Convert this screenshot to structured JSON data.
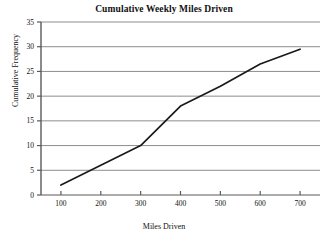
{
  "chart_data": {
    "type": "line",
    "title": "Cumulative Weekly Miles Driven",
    "xlabel": "Miles Driven",
    "ylabel": "Cumulative Frequency",
    "x": [
      100,
      200,
      300,
      400,
      500,
      600,
      700
    ],
    "values": [
      2,
      6,
      10,
      18,
      22,
      26.5,
      29.5
    ],
    "series": [
      {
        "name": "Cumulative Frequency",
        "values": [
          2,
          6,
          10,
          18,
          22,
          26.5,
          29.5
        ]
      }
    ],
    "xlim": [
      50,
      750
    ],
    "ylim": [
      0,
      35
    ],
    "xticks": [
      100,
      200,
      300,
      400,
      500,
      600,
      700
    ],
    "xtick_labels": [
      "100",
      "200",
      "300",
      "400",
      "500",
      "600",
      "700"
    ],
    "yticks": [
      0,
      5,
      10,
      15,
      20,
      25,
      30,
      35
    ],
    "ytick_labels": [
      "0",
      "5",
      "10",
      "15",
      "20",
      "25",
      "30",
      "35"
    ],
    "grid": "horizontal",
    "legend": "none",
    "line_color": "#1a1a1a",
    "grid_color": "#8d8d8d",
    "axis_color": "#5a5a5a",
    "background": "#ffffff"
  }
}
